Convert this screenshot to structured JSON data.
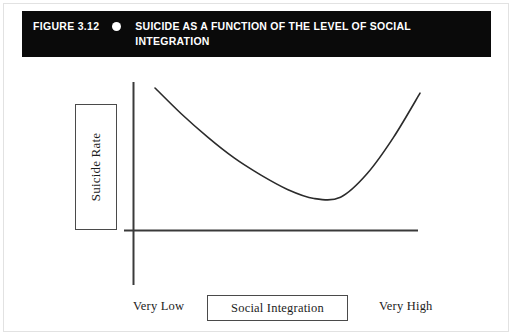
{
  "figure": {
    "number_label": "FIGURE 3.12",
    "bullet_icon": "bullet-dot-icon",
    "title": "SUICIDE AS A FUNCTION OF THE LEVEL OF SOCIAL INTEGRATION",
    "header_background_color": "#0a0a0a",
    "header_text_color": "#ffffff"
  },
  "chart_data": {
    "type": "line",
    "title": "SUICIDE AS A FUNCTION OF THE LEVEL OF SOCIAL INTEGRATION",
    "xlabel": "Social Integration",
    "ylabel": "Suicide Rate",
    "x_tick_labels": [
      "Very Low",
      "Very High"
    ],
    "y_tick_labels": [],
    "grid": false,
    "legend": null,
    "axis_line_color": "#3a3a3a",
    "curve_color": "#2b2b2b",
    "series": [
      {
        "name": "Suicide rate",
        "x": [
          0.0,
          0.1,
          0.2,
          0.3,
          0.4,
          0.5,
          0.6,
          0.7,
          0.8,
          0.9,
          1.0
        ],
        "y": [
          1.0,
          0.8,
          0.62,
          0.46,
          0.33,
          0.22,
          0.15,
          0.16,
          0.34,
          0.62,
          0.96
        ]
      }
    ],
    "xlim": [
      0,
      1
    ],
    "ylim": [
      0,
      1
    ]
  },
  "axes": {
    "y_label_box": {
      "text": "Suicide Rate",
      "rotated": true
    },
    "x_label_box": {
      "text": "Social Integration"
    },
    "x_low": "Very Low",
    "x_high": "Very High"
  }
}
